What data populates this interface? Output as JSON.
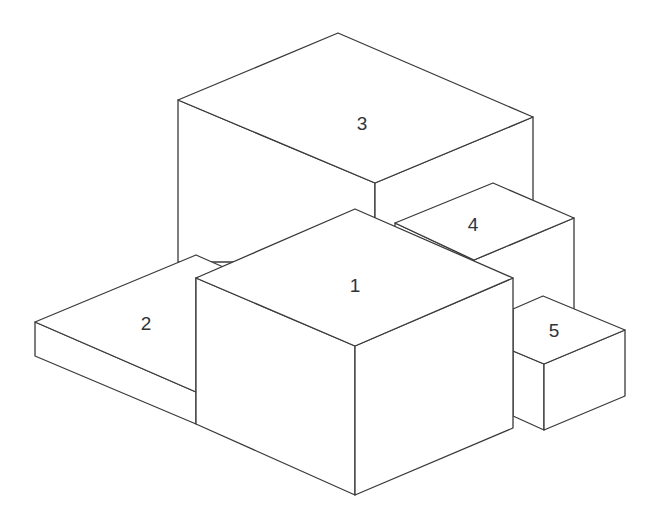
{
  "diagram": {
    "type": "isometric-stacked-boxes",
    "line_color": "#3a3a3a",
    "background": "#ffffff",
    "boxes": [
      {
        "id": "1",
        "label": "1",
        "label_pos": [
          355,
          292
        ]
      },
      {
        "id": "2",
        "label": "2",
        "label_pos": [
          146,
          330
        ]
      },
      {
        "id": "3",
        "label": "3",
        "label_pos": [
          362,
          130
        ]
      },
      {
        "id": "4",
        "label": "4",
        "label_pos": [
          473,
          231
        ]
      },
      {
        "id": "5",
        "label": "5",
        "label_pos": [
          554,
          337
        ]
      }
    ]
  }
}
